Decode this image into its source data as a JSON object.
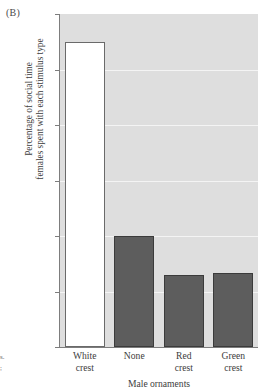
{
  "figure": {
    "panel_label": "(B)",
    "margin_artifact_lines": [
      "s.",
      ";"
    ]
  },
  "chart_data": {
    "type": "bar",
    "title": "",
    "subtitle": "",
    "categories": [
      "White crest",
      "None",
      "Red crest",
      "Green crest"
    ],
    "category_lines": [
      [
        "White",
        "crest"
      ],
      [
        "None",
        ""
      ],
      [
        "Red",
        "crest"
      ],
      [
        "Green",
        "crest"
      ]
    ],
    "values": [
      55,
      20,
      13,
      13.3
    ],
    "series": [
      {
        "name": "Percentage of social time females spent with each stimulus type",
        "values": [
          55,
          20,
          13,
          13.3
        ]
      }
    ],
    "xlabel": "Male ornaments",
    "ylabel": "Percentage of social time females spent with each stimulus type",
    "ylabel_lines": [
      "Percentage of social time",
      "females spent with each stimulus type"
    ],
    "ylim": [
      0,
      60
    ],
    "yticks": [
      0,
      10,
      20,
      30,
      40,
      50,
      60
    ],
    "ytick_labels": [
      "0",
      "10",
      "20",
      "30",
      "40",
      "50",
      "60"
    ],
    "grid": true,
    "grid_axis": "y",
    "legend": false,
    "legend_position": "none",
    "bar_styles": [
      "hollow",
      "filled",
      "filled",
      "filled"
    ],
    "colors": {
      "plot_background": "#dedede",
      "grid": "#f4f4f4",
      "bar_fill": "#5d5d5d",
      "bar_edge": "#3b3b3b",
      "hollow_fill": "#ffffff",
      "hollow_edge": "#6a6a6a",
      "axis": "#7d7d7d",
      "text": "#3d3d3d"
    }
  }
}
